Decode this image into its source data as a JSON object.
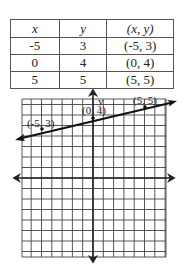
{
  "table": {
    "headers": [
      "x",
      "y",
      "(x, y)"
    ],
    "rows": [
      [
        "-5",
        "3",
        "(-5, 3)"
      ],
      [
        "0",
        "4",
        "(0, 4)"
      ],
      [
        "5",
        "5",
        "(5, 5)"
      ]
    ]
  },
  "graph": {
    "y_axis_label": "y",
    "points": [
      {
        "label": "(-5, 3)",
        "x": -5,
        "y": 3
      },
      {
        "label": "(0, 4)",
        "x": 0,
        "y": 4
      },
      {
        "label": "(5, 5)",
        "x": 5,
        "y": 5
      }
    ]
  },
  "chart_data": {
    "type": "line",
    "title": "",
    "xlabel": "x",
    "ylabel": "y",
    "x": [
      -5,
      0,
      5
    ],
    "series": [
      {
        "name": "line through points",
        "values": [
          3,
          4,
          5
        ]
      }
    ],
    "point_labels": [
      "(-5, 3)",
      "(0, 4)",
      "(5, 5)"
    ],
    "grid": true,
    "axis_arrows": true,
    "line_arrows": true,
    "table": {
      "columns": [
        "x",
        "y",
        "(x, y)"
      ],
      "rows": [
        [
          "-5",
          "3",
          "(-5, 3)"
        ],
        [
          "0",
          "4",
          "(0, 4)"
        ],
        [
          "5",
          "5",
          "(5, 5)"
        ]
      ]
    }
  }
}
